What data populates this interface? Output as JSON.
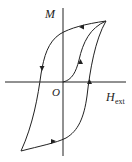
{
  "diagram": {
    "type": "hysteresis-loop",
    "labels": {
      "y_axis": "M",
      "origin": "O",
      "x_axis_main": "H",
      "x_axis_sub": "ext"
    },
    "colors": {
      "stroke": "#222222",
      "background": "#ffffff"
    },
    "curves": [
      {
        "name": "initial-magnetization-curve",
        "direction": "from origin to positive saturation"
      },
      {
        "name": "descending-branch",
        "direction": "from positive saturation to negative saturation"
      },
      {
        "name": "ascending-branch",
        "direction": "from negative saturation to positive saturation"
      }
    ]
  }
}
